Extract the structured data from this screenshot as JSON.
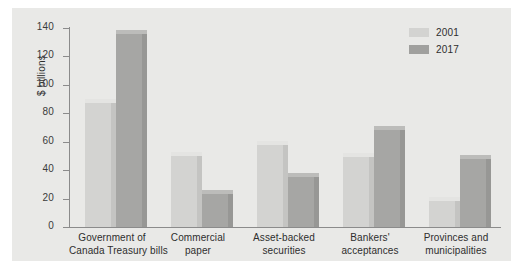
{
  "chart_data": {
    "type": "bar",
    "title": "",
    "xlabel": "",
    "ylabel": "$ billions",
    "ylim": [
      0,
      140
    ],
    "yticks": [
      0,
      20,
      40,
      60,
      80,
      100,
      120,
      140
    ],
    "grid": false,
    "legend_position": "top-right",
    "categories": [
      "Government of\nCanada Treasury bills",
      "Commercial\npaper",
      "Asset-backed\nsecurities",
      "Bankers'\nacceptances",
      "Provinces and\nmunicipalities"
    ],
    "series": [
      {
        "name": "2001",
        "color": "#d3d3d1",
        "values": [
          87,
          50,
          58,
          49,
          18
        ]
      },
      {
        "name": "2017",
        "color": "#a0a09e",
        "values": [
          136,
          23,
          35,
          68,
          48
        ]
      }
    ]
  },
  "axis": {
    "ylabel": "$ billions",
    "ticks": [
      {
        "label": "140",
        "value": 140
      },
      {
        "label": "120",
        "value": 120
      },
      {
        "label": "100",
        "value": 100
      },
      {
        "label": "80",
        "value": 80
      },
      {
        "label": "60",
        "value": 60
      },
      {
        "label": "40",
        "value": 40
      },
      {
        "label": "20",
        "value": 20
      },
      {
        "label": "0",
        "value": 0
      }
    ]
  },
  "legend": {
    "items": [
      {
        "label": "2001",
        "color": "#d3d3d1"
      },
      {
        "label": "2017",
        "color": "#a0a09e"
      }
    ]
  },
  "categories": [
    {
      "line1": "Government of",
      "line2": "Canada Treasury bills"
    },
    {
      "line1": "Commercial",
      "line2": "paper"
    },
    {
      "line1": "Asset-backed",
      "line2": "securities"
    },
    {
      "line1": "Bankers'",
      "line2": "acceptances"
    },
    {
      "line1": "Provinces and",
      "line2": "municipalities"
    }
  ]
}
